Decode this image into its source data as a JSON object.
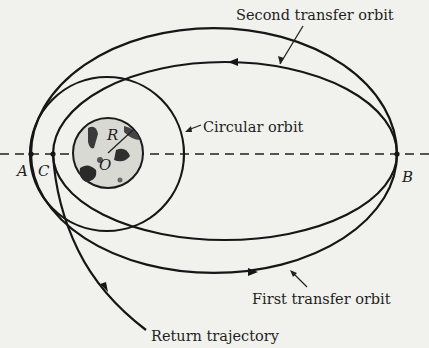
{
  "figure": {
    "labels": {
      "second_transfer_orbit": "Second transfer orbit",
      "circular_orbit": "Circular orbit",
      "first_transfer_orbit": "First transfer orbit",
      "return_trajectory": "Return trajectory"
    },
    "points": {
      "A": "A",
      "B": "B",
      "C": "C",
      "R": "R",
      "O": "O"
    },
    "colors": {
      "background": "#f1f1ee",
      "line": "#161616"
    }
  }
}
